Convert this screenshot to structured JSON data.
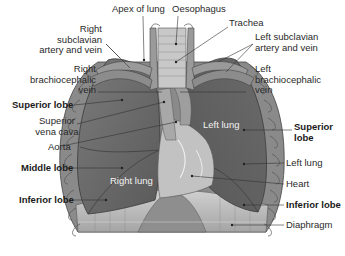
{
  "labels": {
    "apex_of_lung": "Apex of lung",
    "oesophagus": "Oesophagus",
    "trachea": "Trachea",
    "right_subclavian": "Right subclavian\nartery and vein",
    "left_subclavian": "Left subclavian\nartery and vein",
    "right_brachiocephalic": "Right\nbrachiocephalic\nvein",
    "left_brachiocephalic": "Left\nbrachiocephalic\nvein",
    "superior_lobe_right": "Superior lobe",
    "superior_vena_cava": "Superior\nvena cava",
    "aorta": "Aorta",
    "middle_lobe": "Middle lobe",
    "inferior_lobe_right": "Inferior lobe",
    "superior_lobe_left": "Superior\nlobe",
    "left_lung_label": "Left lung",
    "heart": "Heart",
    "inferior_lobe_left": "Inferior lobe",
    "diaphragm": "Diaphragm"
  },
  "inner_labels": {
    "left_lung": "Left lung",
    "right_lung": "Right lung"
  },
  "colors": {
    "lung": "#6e6e6e",
    "lung_dark": "#555555",
    "heart": "#c8c8c8",
    "diaphragm": "#b5b5b5",
    "ribs": "#ffffff",
    "leader_line": "#333333"
  }
}
